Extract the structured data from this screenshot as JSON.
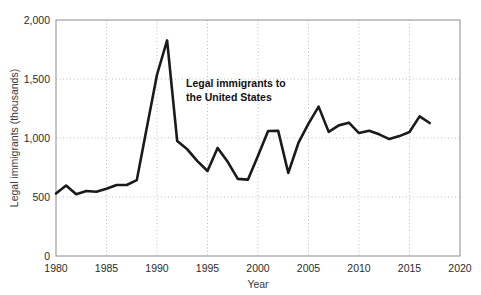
{
  "chart_data": {
    "type": "line",
    "title": "",
    "xlabel": "Year",
    "ylabel": "Legal immigrants (thousands)",
    "xlim": [
      1980,
      2020
    ],
    "ylim": [
      0,
      2000
    ],
    "xticks": [
      1980,
      1985,
      1990,
      1995,
      2000,
      2005,
      2010,
      2015,
      2020
    ],
    "xtick_labels": [
      "1980",
      "1985",
      "1990",
      "1995",
      "2000",
      "2005",
      "2010",
      "2015",
      "2020"
    ],
    "yticks": [
      0,
      500,
      1000,
      1500,
      2000
    ],
    "ytick_labels": [
      "0",
      "500",
      "1,000",
      "1,500",
      "2,000"
    ],
    "grid": "vertical-dotted-and-horizontal-dotted",
    "legend": "none",
    "annotations": [
      {
        "name": "series-annotation",
        "text_line1": "Legal immigrants to",
        "text_line2": "the United States",
        "x": 1994,
        "y": 1400
      }
    ],
    "series": [
      {
        "name": "Legal immigrants to the United States",
        "color": "#1a1a1a",
        "x": [
          1980,
          1981,
          1982,
          1983,
          1984,
          1985,
          1986,
          1987,
          1988,
          1989,
          1990,
          1991,
          1992,
          1993,
          1994,
          1995,
          1996,
          1997,
          1998,
          1999,
          2000,
          2001,
          2002,
          2003,
          2004,
          2005,
          2006,
          2007,
          2008,
          2009,
          2010,
          2011,
          2012,
          2013,
          2014,
          2015,
          2016,
          2017
        ],
        "values": [
          530,
          597,
          524,
          551,
          544,
          570,
          602,
          602,
          643,
          1091,
          1536,
          1827,
          974,
          904,
          804,
          720,
          916,
          798,
          654,
          647,
          850,
          1059,
          1060,
          704,
          958,
          1122,
          1266,
          1052,
          1107,
          1130,
          1042,
          1062,
          1031,
          991,
          1016,
          1051,
          1183,
          1127
        ]
      }
    ]
  }
}
